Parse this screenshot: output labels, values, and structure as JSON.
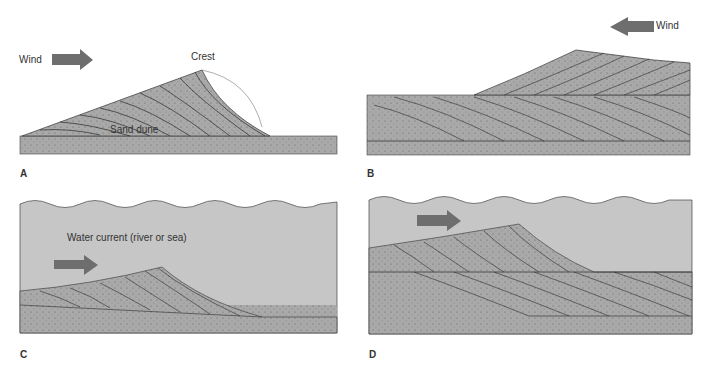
{
  "figure": {
    "panels": [
      {
        "id": "A",
        "label": "A",
        "wind_label": "Wind",
        "crest_label": "Crest",
        "dune_label": "Sand dune",
        "arrow_direction": "right",
        "setting": "air"
      },
      {
        "id": "B",
        "label": "B",
        "wind_label": "Wind",
        "arrow_direction": "left",
        "setting": "air"
      },
      {
        "id": "C",
        "label": "C",
        "current_label": "Water current (river or sea)",
        "arrow_direction": "right",
        "setting": "water"
      },
      {
        "id": "D",
        "label": "D",
        "arrow_direction": "right",
        "setting": "water"
      }
    ],
    "colors": {
      "sand": "#a9a9a9",
      "water": "#c6c6c6",
      "arrow": "#6e6e6e",
      "line": "#2a2a2a",
      "background": "#ffffff"
    }
  }
}
